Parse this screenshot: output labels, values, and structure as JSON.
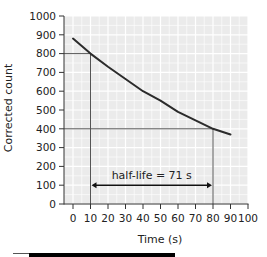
{
  "chart_data": {
    "type": "line",
    "title": "",
    "xlabel": "Time (s)",
    "ylabel": "Corrected count",
    "xlim": [
      0,
      100
    ],
    "ylim": [
      0,
      1000
    ],
    "x_ticks": [
      0,
      10,
      20,
      30,
      40,
      50,
      60,
      70,
      80,
      90,
      100
    ],
    "y_ticks": [
      0,
      100,
      200,
      300,
      400,
      500,
      600,
      700,
      800,
      900,
      1000
    ],
    "grid": true,
    "legend": null,
    "series": [
      {
        "name": "Corrected count",
        "x": [
          0,
          10,
          20,
          30,
          40,
          50,
          60,
          70,
          80,
          90
        ],
        "values": [
          880,
          800,
          730,
          665,
          600,
          550,
          490,
          445,
          400,
          370
        ]
      }
    ],
    "annotations": [
      {
        "type": "guide-line",
        "from": [
          0,
          800
        ],
        "to": [
          10,
          800
        ]
      },
      {
        "type": "guide-line",
        "from": [
          10,
          800
        ],
        "to": [
          10,
          0
        ]
      },
      {
        "type": "guide-line",
        "from": [
          0,
          400
        ],
        "to": [
          80,
          400
        ]
      },
      {
        "type": "guide-line",
        "from": [
          80,
          400
        ],
        "to": [
          80,
          0
        ]
      },
      {
        "type": "double-arrow",
        "from": [
          10,
          100
        ],
        "to": [
          80,
          100
        ]
      },
      {
        "type": "text",
        "text": "half-life = 71 s",
        "at": [
          45,
          150
        ]
      }
    ],
    "colors": {
      "line": "#2b2b2b",
      "guide": "#555555",
      "plot_bg": "#ebebeb",
      "grid": "#ffffff"
    }
  },
  "labels": {
    "xlabel": "Time (s)",
    "ylabel": "Corrected count",
    "annotation": "half-life = 71 s"
  }
}
